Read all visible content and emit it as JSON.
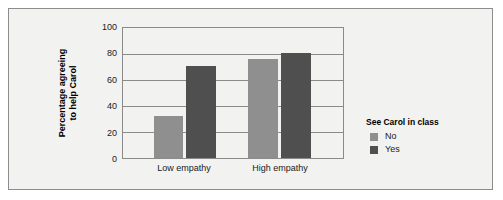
{
  "chart_data": {
    "type": "bar",
    "title": "",
    "subtitle": "",
    "xlabel": "",
    "ylabel": "Percentage agreeing to help Carol",
    "ylabel_lines": [
      "Percentage agreeing",
      "to help Carol"
    ],
    "categories": [
      "Low empathy",
      "High empathy"
    ],
    "series": [
      {
        "name": "No",
        "values": [
          32,
          76
        ],
        "color": "#8f8f8f"
      },
      {
        "name": "Yes",
        "values": [
          71,
          81
        ],
        "color": "#4f4f4f"
      }
    ],
    "ylim": [
      0,
      100
    ],
    "yticks": [
      0,
      20,
      40,
      60,
      80,
      100
    ],
    "ytick_labels": [
      "0",
      "20",
      "40",
      "60",
      "80",
      "100"
    ],
    "grid": true,
    "grid_axis": "y",
    "legend": {
      "title": "See Carol in class",
      "position": "right",
      "entries": [
        {
          "label": "No",
          "color": "#8f8f8f"
        },
        {
          "label": "Yes",
          "color": "#4f4f4f"
        }
      ]
    },
    "colors": {
      "figure_background": "#f2f2f1",
      "plot_background": "#f2f2f1",
      "axis": "#8a8a8a",
      "grid": "#8a8a8a",
      "text": "#1a1a1a",
      "border": "#8d8d8d"
    }
  }
}
